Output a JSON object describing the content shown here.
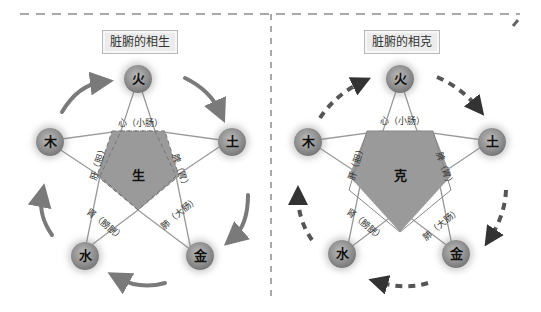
{
  "left_panel": {
    "title": "脏腑的相生",
    "center": "生",
    "nodes": {
      "fire": "火",
      "earth": "土",
      "metal": "金",
      "water": "水",
      "wood": "木"
    },
    "segments": {
      "top": "心（小肠）",
      "right": "脾（胃）",
      "bottom_right": "肺（大肠）",
      "bottom_left": "肾（膀胱）",
      "left": "肝（胆）"
    },
    "arrow_style": "solid-curved",
    "arrow_direction": "clockwise"
  },
  "right_panel": {
    "title": "脏腑的相克",
    "center": "克",
    "nodes": {
      "fire": "火",
      "earth": "土",
      "metal": "金",
      "water": "水",
      "wood": "木"
    },
    "segments": {
      "top": "心（小肠）",
      "right": "脾（胃）",
      "bottom_right": "肺（大肠）",
      "bottom_left": "肾（膀胱）",
      "left": "肝（胆）"
    },
    "arrow_style": "dashed-curved",
    "arrow_direction": "clockwise"
  },
  "colors": {
    "pentagon_fill": "#9a9a9a",
    "node_fill": "#8a8a8a",
    "arrow": "#7a7a7a",
    "divider": "#8c8c8c",
    "title_bg": "#ececec"
  }
}
